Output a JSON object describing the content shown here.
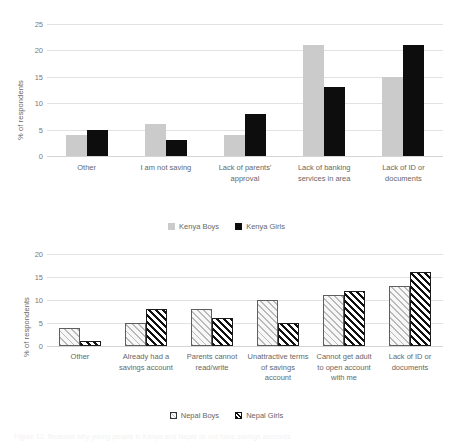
{
  "figure": {
    "caption": "Figure 12: Reasons why young people in Kenya and Nepal do not have savings accounts"
  },
  "charts": [
    {
      "id": "kenya",
      "ylabel": "% of respondents",
      "yticks": [
        "0",
        "5",
        "10",
        "15",
        "20",
        "25"
      ],
      "legend": [
        {
          "label": "Kenya Boys",
          "swatch": "kb"
        },
        {
          "label": "Kenya Girls",
          "swatch": "kg"
        }
      ],
      "categories": [
        "Other",
        "I am not saving",
        "Lack of parents' approval",
        "Lack of banking services in area",
        "Lack of ID or documents"
      ]
    },
    {
      "id": "nepal",
      "ylabel": "% of respondents",
      "yticks": [
        "0",
        "5",
        "10",
        "15",
        "20"
      ],
      "legend": [
        {
          "label": "Nepal Boys",
          "swatch": "nb"
        },
        {
          "label": "Nepal Girls",
          "swatch": "ng"
        }
      ],
      "categories": [
        "Other",
        "Already had a savings account",
        "Parents cannot read/write",
        "Unattractive terms of savings account",
        "Cannot get adult to open account with me",
        "Lack of ID or documents"
      ]
    }
  ],
  "chart_data": [
    {
      "type": "bar",
      "title": "",
      "xlabel": "",
      "ylabel": "% of respondents",
      "ylim": [
        0,
        25
      ],
      "ytick_step": 5,
      "grid": true,
      "legend_position": "bottom",
      "categories": [
        "Other",
        "I am not saving",
        "Lack of parents' approval",
        "Lack of banking services in area",
        "Lack of ID or documents"
      ],
      "series": [
        {
          "name": "Kenya Boys",
          "color": "#cbcbcb",
          "values": [
            4,
            6,
            4,
            21,
            15
          ]
        },
        {
          "name": "Kenya Girls",
          "color": "#0d0d0d",
          "values": [
            5,
            3,
            8,
            13,
            21
          ]
        }
      ]
    },
    {
      "type": "bar",
      "title": "",
      "xlabel": "",
      "ylabel": "% of respondents",
      "ylim": [
        0,
        20
      ],
      "ytick_step": 5,
      "grid": true,
      "legend_position": "bottom",
      "categories": [
        "Other",
        "Already had a savings account",
        "Parents cannot read/write",
        "Unattractive terms of savings account",
        "Cannot get adult to open account with me",
        "Lack of ID or documents"
      ],
      "series": [
        {
          "name": "Nepal Boys",
          "color": "#f2f2f2",
          "pattern": "diagonal-light-hatch",
          "values": [
            4,
            5,
            8,
            10,
            11,
            13
          ]
        },
        {
          "name": "Nepal Girls",
          "color": "#ffffff",
          "pattern": "diagonal-dark-hatch",
          "values": [
            1,
            8,
            6,
            5,
            12,
            16
          ]
        }
      ]
    }
  ]
}
